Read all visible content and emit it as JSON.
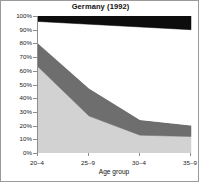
{
  "chart_data": {
    "type": "area",
    "stacked": true,
    "normalized_percent": true,
    "title": "Germany (1992)",
    "xlabel": "Age group",
    "ylabel": "",
    "categories": [
      "20–4",
      "25–9",
      "30–4",
      "35–9"
    ],
    "ylim": [
      0,
      100
    ],
    "yticks": [
      "0%",
      "10%",
      "20%",
      "30%",
      "40%",
      "50%",
      "60%",
      "70%",
      "80%",
      "90%",
      "100%"
    ],
    "ytick_values": [
      0,
      10,
      20,
      30,
      40,
      50,
      60,
      70,
      80,
      90,
      100
    ],
    "grid": false,
    "legend": "none",
    "series": [
      {
        "name": "band-1-light-gray",
        "color": "#d2d2d2",
        "values": [
          63,
          27,
          13,
          12
        ],
        "cumulative_top": [
          63,
          27,
          13,
          12
        ]
      },
      {
        "name": "band-2-dark-gray",
        "color": "#6e6e6e",
        "values": [
          17,
          20,
          11,
          8
        ],
        "cumulative_top": [
          80,
          47,
          24,
          20
        ]
      },
      {
        "name": "band-3-white",
        "color": "#ffffff",
        "values": [
          16,
          47,
          68,
          70
        ],
        "cumulative_top": [
          96,
          94,
          92,
          90
        ]
      },
      {
        "name": "band-4-black",
        "color": "#0d0d0d",
        "values": [
          4,
          6,
          8,
          10
        ],
        "cumulative_top": [
          100,
          100,
          100,
          100
        ]
      }
    ]
  },
  "figure": {
    "title": "Germany (1992)",
    "x_axis_title": "Age group",
    "frame_color": "#9a9a9a"
  }
}
